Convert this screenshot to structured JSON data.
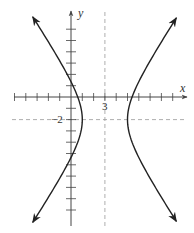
{
  "chart_data": {
    "type": "line",
    "title": "",
    "equation": "(x-3)^2/4 - (y+2)^2/9 = 1",
    "center": [
      3,
      -2
    ],
    "a": 2,
    "b": 3,
    "vertices": [
      [
        1,
        -2
      ],
      [
        5,
        -2
      ]
    ],
    "xlabel": "x",
    "ylabel": "y",
    "xlim": [
      -5,
      10
    ],
    "ylim": [
      -11,
      7
    ],
    "grid": false,
    "legend": null,
    "tick_spacing": 1,
    "x_ticks": [
      -5,
      -4,
      -3,
      -2,
      -1,
      1,
      2,
      3,
      4,
      5,
      6,
      7,
      8,
      9
    ],
    "y_ticks": [
      6,
      5,
      4,
      3,
      2,
      1,
      -1,
      -2,
      -3,
      -4,
      -5,
      -6,
      -7,
      -8,
      -9,
      -10
    ],
    "annotations": [
      {
        "text": "3",
        "x": 3,
        "y": 0,
        "role": "x-coordinate of center"
      },
      {
        "text": "-2",
        "x": 0,
        "y": -2,
        "role": "y-coordinate of center"
      }
    ],
    "dashed_lines": [
      {
        "orientation": "vertical",
        "value": 3
      },
      {
        "orientation": "horizontal",
        "value": -2
      }
    ],
    "series": [
      {
        "name": "left branch",
        "x_at_vertex": 1,
        "y_range": [
          -11.1,
          7.1
        ],
        "arrows": "both ends"
      },
      {
        "name": "right branch",
        "x_at_vertex": 5,
        "y_range": [
          -11.0,
          7.0
        ],
        "arrows": "both ends"
      }
    ]
  },
  "layout": {
    "origin_px": [
      71,
      97
    ],
    "unit_px": 11.3,
    "curve_color": "#222222",
    "axis_color": "#444444",
    "dash_color": "#999999"
  },
  "labels": {
    "x_axis": "x",
    "y_axis": "y",
    "center_x": "3",
    "center_y": "−2"
  }
}
